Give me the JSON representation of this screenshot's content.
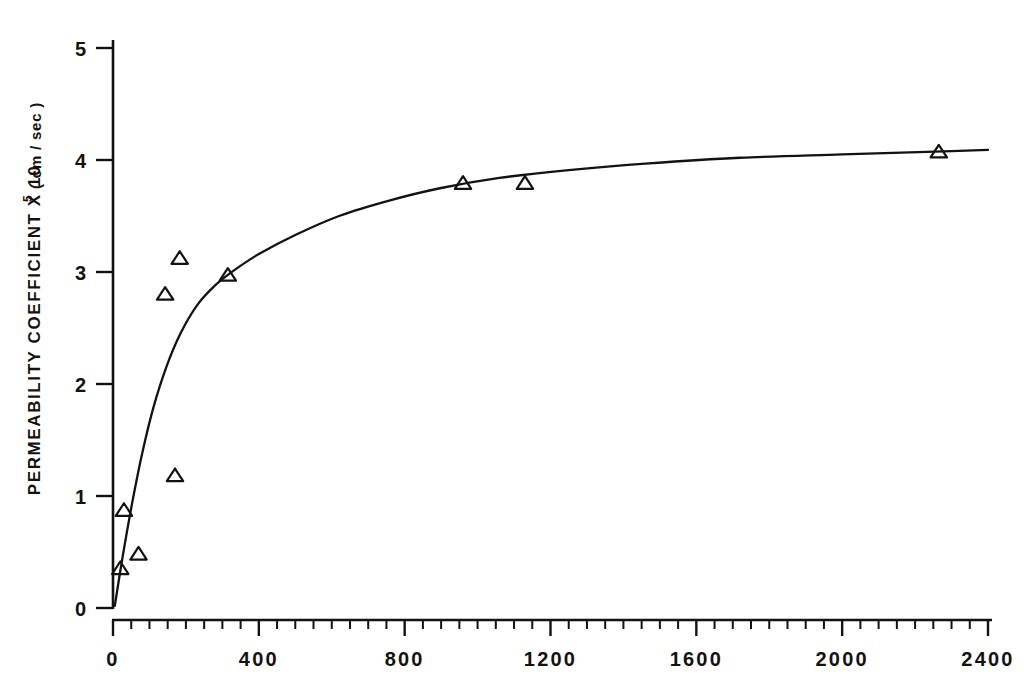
{
  "figure": {
    "background_color": "#ffffff",
    "ink_color": "#14120f"
  },
  "chart_data": {
    "type": "scatter",
    "title": "",
    "subtitle": "",
    "xlabel": "",
    "ylabel_full": "PERMEABILITY COEFFICIENT X 10⁵ (cm/sec)",
    "ylabel_main": "PERMEABILITY  COEFFICIENT  X  10",
    "ylabel_exponent": "5",
    "ylabel_unit": "( cm / sec )",
    "xlim": [
      0,
      2400
    ],
    "ylim": [
      0,
      5
    ],
    "xticks": [
      0,
      400,
      800,
      1200,
      1600,
      2000,
      2400
    ],
    "xticklabels": [
      "0",
      "400",
      "800",
      "1200",
      "1600",
      "2000",
      "2400"
    ],
    "yticks": [
      0,
      1,
      2,
      3,
      4,
      5
    ],
    "yticklabels": [
      "0",
      "1",
      "2",
      "3",
      "4",
      "5"
    ],
    "x_minor_tick_step": 50,
    "grid": false,
    "legend": null,
    "marker": "open-triangle",
    "series": [
      {
        "name": "measured",
        "marker": "open-triangle",
        "points": [
          {
            "x": 20,
            "y": 0.35
          },
          {
            "x": 30,
            "y": 0.87
          },
          {
            "x": 70,
            "y": 0.48
          },
          {
            "x": 143,
            "y": 2.8
          },
          {
            "x": 170,
            "y": 1.18
          },
          {
            "x": 183,
            "y": 3.12
          },
          {
            "x": 315,
            "y": 2.97
          },
          {
            "x": 960,
            "y": 3.79
          },
          {
            "x": 1130,
            "y": 3.79
          },
          {
            "x": 2265,
            "y": 4.07
          }
        ]
      },
      {
        "name": "fitted-curve",
        "type": "line",
        "points": [
          {
            "x": 5,
            "y": 0.02
          },
          {
            "x": 20,
            "y": 0.33
          },
          {
            "x": 35,
            "y": 0.62
          },
          {
            "x": 55,
            "y": 0.98
          },
          {
            "x": 80,
            "y": 1.38
          },
          {
            "x": 110,
            "y": 1.78
          },
          {
            "x": 145,
            "y": 2.14
          },
          {
            "x": 185,
            "y": 2.45
          },
          {
            "x": 230,
            "y": 2.7
          },
          {
            "x": 280,
            "y": 2.88
          },
          {
            "x": 330,
            "y": 3.01
          },
          {
            "x": 400,
            "y": 3.16
          },
          {
            "x": 500,
            "y": 3.33
          },
          {
            "x": 620,
            "y": 3.5
          },
          {
            "x": 760,
            "y": 3.64
          },
          {
            "x": 900,
            "y": 3.75
          },
          {
            "x": 1060,
            "y": 3.84
          },
          {
            "x": 1250,
            "y": 3.91
          },
          {
            "x": 1470,
            "y": 3.97
          },
          {
            "x": 1720,
            "y": 4.02
          },
          {
            "x": 2000,
            "y": 4.05
          },
          {
            "x": 2300,
            "y": 4.08
          },
          {
            "x": 2400,
            "y": 4.09
          }
        ]
      }
    ]
  }
}
